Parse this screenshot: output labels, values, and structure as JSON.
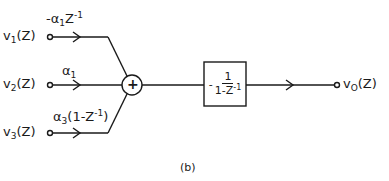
{
  "diagram": {
    "caption": "(b)",
    "inputs": [
      {
        "name": "v",
        "sub": "1",
        "arg": "(Z)",
        "gain": {
          "prefix": "-α",
          "sub": "1",
          "mid": "Z",
          "sup": "-1",
          "suffix": ""
        }
      },
      {
        "name": "v",
        "sub": "2",
        "arg": "(Z)",
        "gain": {
          "prefix": "α",
          "sub": "1",
          "mid": "",
          "sup": "",
          "suffix": ""
        }
      },
      {
        "name": "v",
        "sub": "3",
        "arg": "(Z)",
        "gain": {
          "prefix": "α",
          "sub": "3",
          "mid": "(1-Z",
          "sup": "-1",
          "suffix": ")"
        }
      }
    ],
    "summer": {
      "symbol": "+"
    },
    "block": {
      "sign": "-",
      "numerator": "1",
      "denominator": "1-Z",
      "den_sup": "-1"
    },
    "output": {
      "name": "v",
      "sub": "O",
      "arg": "(Z)"
    },
    "colors": {
      "stroke": "#1a1a1a",
      "background": "#ffffff"
    }
  }
}
